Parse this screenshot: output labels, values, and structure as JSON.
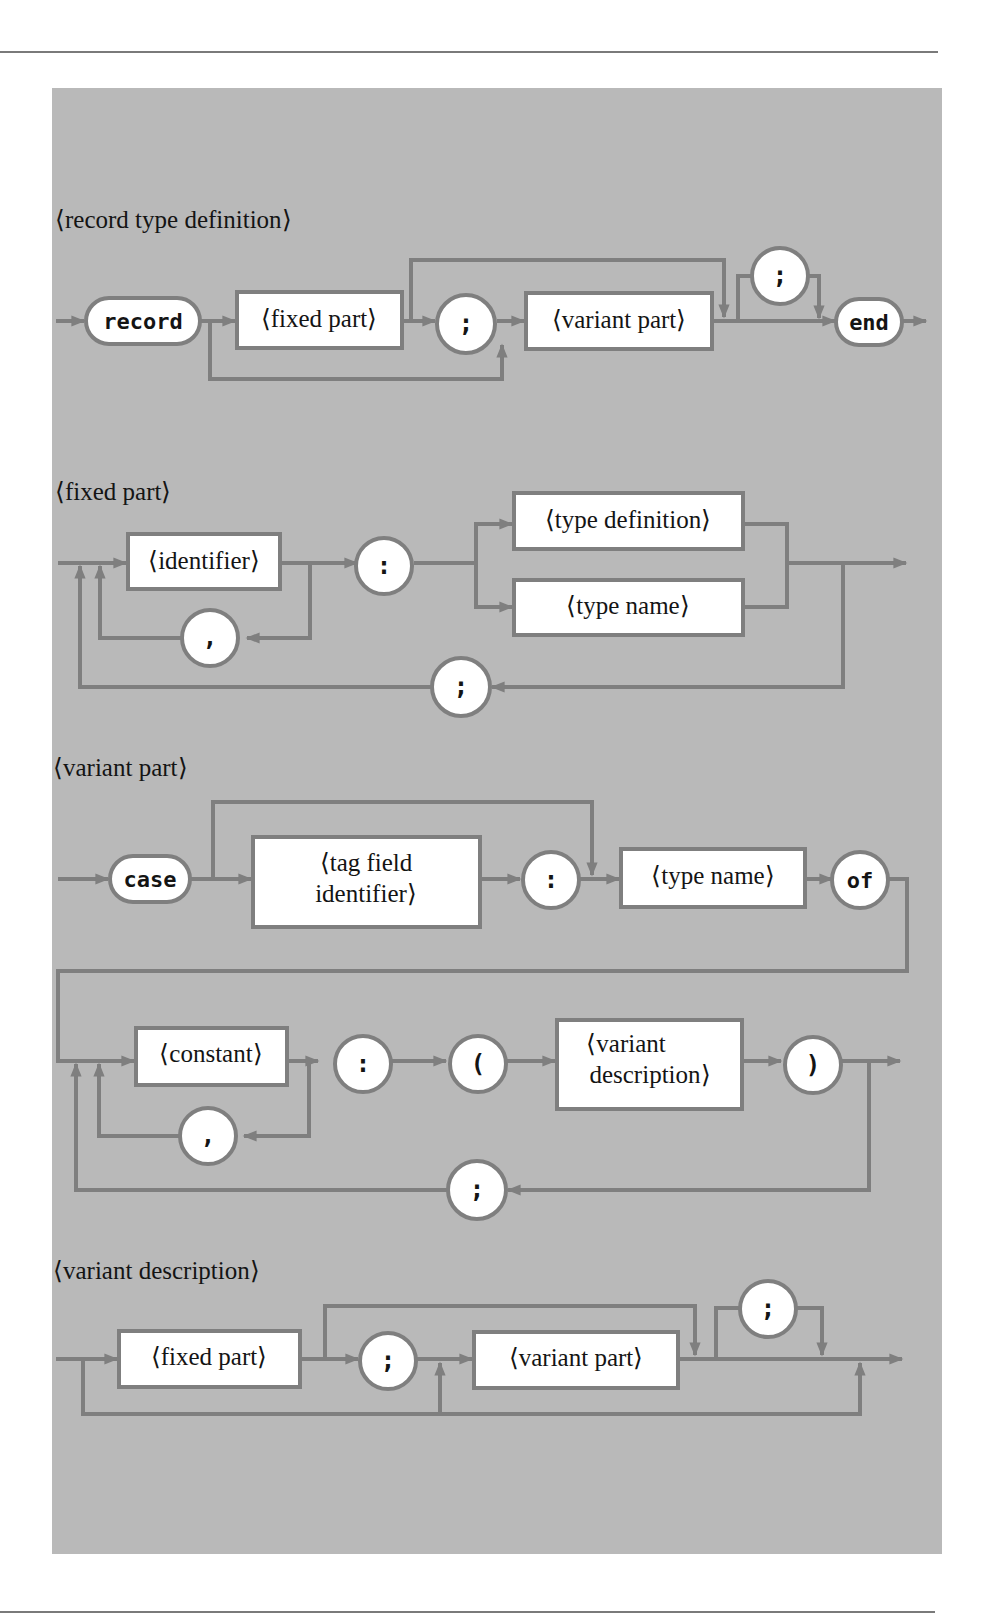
{
  "diagrams": {
    "record_type_definition": {
      "title": "⟨record type definition⟩",
      "record_kw": "record",
      "fixed_part": "⟨fixed part⟩",
      "semicolon1": ";",
      "variant_part": "⟨variant part⟩",
      "semicolon2": ";",
      "end_kw": "end"
    },
    "fixed_part": {
      "title": "⟨fixed part⟩",
      "identifier": "⟨identifier⟩",
      "colon": ":",
      "type_definition": "⟨type definition⟩",
      "type_name": "⟨type name⟩",
      "comma": ",",
      "semicolon": ";"
    },
    "variant_part": {
      "title": "⟨variant part⟩",
      "case_kw": "case",
      "tag_field_line1": "⟨tag field",
      "tag_field_line2": "identifier⟩",
      "colon1": ":",
      "type_name": "⟨type name⟩",
      "of_kw": "of",
      "constant": "⟨constant⟩",
      "comma": ",",
      "colon2": ":",
      "lparen": "(",
      "variant_desc_line1": "⟨variant",
      "variant_desc_line2": "description⟩",
      "rparen": ")",
      "semicolon": ";"
    },
    "variant_description": {
      "title": "⟨variant description⟩",
      "fixed_part": "⟨fixed part⟩",
      "semicolon1": ";",
      "variant_part": "⟨variant part⟩",
      "semicolon2": ";"
    }
  },
  "colors": {
    "panel": "#b9b9b9",
    "line": "#7f7f7f",
    "node_fill": "#ffffff",
    "text": "#141414"
  }
}
